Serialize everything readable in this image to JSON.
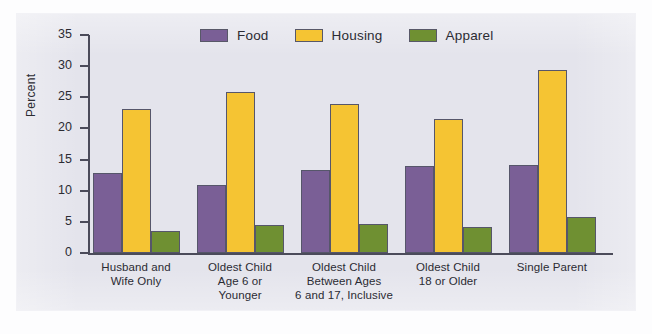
{
  "chart_data": {
    "type": "bar",
    "title": "",
    "xlabel": "",
    "ylabel": "Percent",
    "ylim": [
      0,
      35
    ],
    "yticks": [
      0,
      5,
      10,
      15,
      20,
      25,
      30,
      35
    ],
    "grid": false,
    "legend_position": "top-center",
    "categories": [
      "Husband and Wife Only",
      "Oldest Child Age 6 or Younger",
      "Oldest Child Between Ages 6 and 17, Inclusive",
      "Oldest Child 18 or Older",
      "Single Parent"
    ],
    "category_lines": [
      [
        "Husband and",
        "Wife Only"
      ],
      [
        "Oldest Child",
        "Age 6 or",
        "Younger"
      ],
      [
        "Oldest Child",
        "Between Ages",
        "6 and 17, Inclusive"
      ],
      [
        "Oldest Child",
        "18 or Older"
      ],
      [
        "Single Parent"
      ]
    ],
    "series": [
      {
        "name": "Food",
        "color": "#7a5f96",
        "values": [
          12.9,
          11.0,
          13.3,
          14.0,
          14.2
        ]
      },
      {
        "name": "Housing",
        "color": "#f5c433",
        "values": [
          23.1,
          25.9,
          24.0,
          21.5,
          29.4
        ]
      },
      {
        "name": "Apparel",
        "color": "#6f9032",
        "values": [
          3.6,
          4.5,
          4.7,
          4.2,
          5.8
        ]
      }
    ]
  },
  "legend": {
    "entries": [
      {
        "label": "Food",
        "swatch": "#7a5f96"
      },
      {
        "label": "Housing",
        "swatch": "#f5c433"
      },
      {
        "label": "Apparel",
        "swatch": "#6f9032"
      }
    ]
  },
  "axis": {
    "y_label": "Percent",
    "y_ticks": [
      "35",
      "30",
      "25",
      "20",
      "15",
      "10",
      "5",
      "0"
    ]
  }
}
